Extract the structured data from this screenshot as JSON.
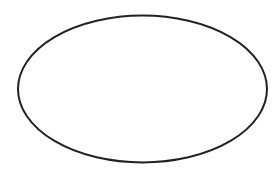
{
  "canvas": {
    "width": 280,
    "height": 169,
    "background": "#ffffff"
  },
  "shapes": [
    {
      "type": "ellipse",
      "cx": 142.5,
      "cy": 89,
      "rx": 124.5,
      "ry": 73.5,
      "fill": "#ffffff",
      "stroke": "#222222",
      "stroke_width": 2
    }
  ]
}
